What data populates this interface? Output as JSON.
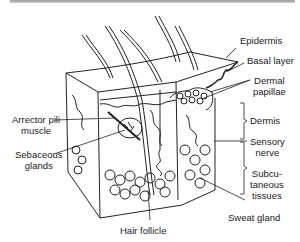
{
  "figure": {
    "labels": {
      "epidermis": "Epidermis",
      "basal_layer": "Basal layer",
      "dermal_papillae_1": "Dermal",
      "dermal_papillae_2": "papillae",
      "dermis": "Dermis",
      "sensory_nerve_1": "Sensory",
      "sensory_nerve_2": "nerve",
      "subcutaneous_1": "Subcu-",
      "subcutaneous_2": "taneous",
      "subcutaneous_3": "tissues",
      "sweat_gland": "Sweat gland",
      "hair_follicle": "Hair follicle",
      "arrector_1": "Arrector pili",
      "arrector_2": "muscle",
      "sebaceous_1": "Sebaceous",
      "sebaceous_2": "glands"
    }
  }
}
